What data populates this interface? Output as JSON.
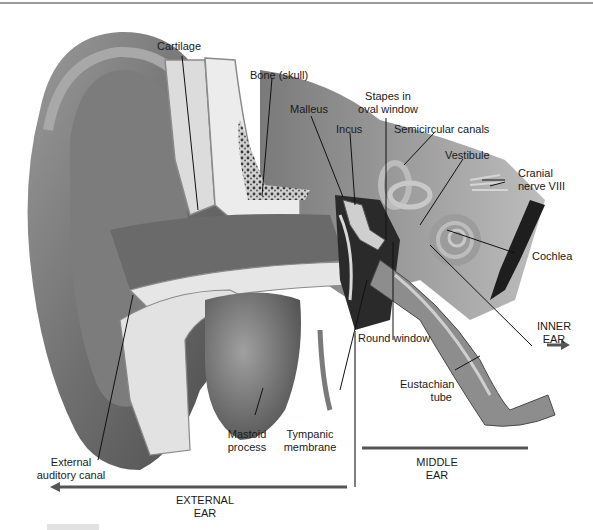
{
  "diagram": {
    "labels": {
      "cartilage": "Cartilage",
      "bone_skull": "Bone (skull)",
      "malleus": "Malleus",
      "incus": "Incus",
      "stapes_line1": "Stapes in",
      "stapes_line2": "oval window",
      "semicircular_canals": "Semicircular canals",
      "vestibule": "Vestibule",
      "cranial_line1": "Cranial",
      "cranial_line2": "nerve VIII",
      "cochlea": "Cochlea",
      "round_window": "Round window",
      "eustachian_line1": "Eustachian",
      "eustachian_line2": "tube",
      "mastoid_line1": "Mastoid",
      "mastoid_line2": "process",
      "tympanic_line1": "Tympanic",
      "tympanic_line2": "membrane",
      "external_canal_line1": "External",
      "external_canal_line2": "auditory canal"
    },
    "regions": {
      "inner_line1": "INNER",
      "inner_line2": "EAR",
      "middle_line1": "MIDDLE",
      "middle_line2": "EAR",
      "external_line1": "EXTERNAL",
      "external_line2": "EAR"
    },
    "colors": {
      "skin_dark": "#5a5a5a",
      "skin_mid": "#8a8a8a",
      "skin_light": "#b8b8b8",
      "bone": "#e4e4e4",
      "cavity": "#2a2a2a",
      "arrow": "#555555"
    }
  }
}
